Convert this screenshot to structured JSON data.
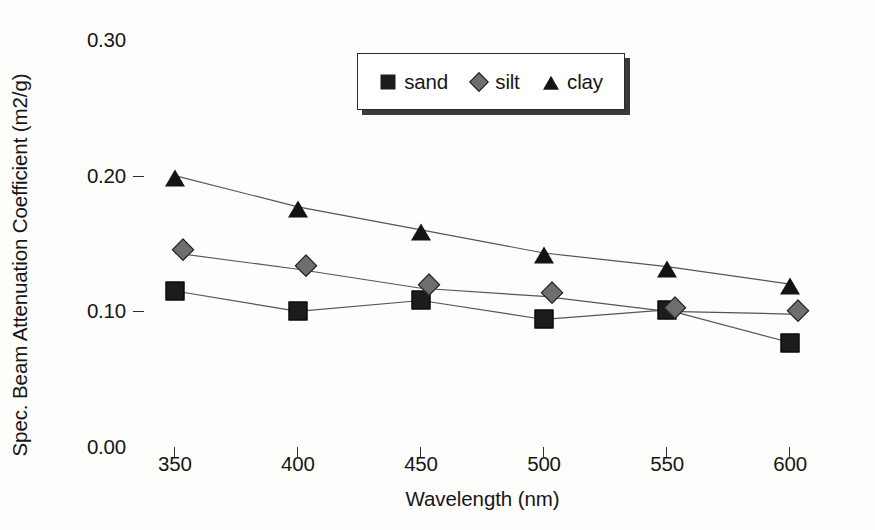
{
  "chart_data": {
    "type": "line",
    "title": "",
    "xlabel": "Wavelength (nm)",
    "ylabel": "Spec. Beam Attenuation Coefficient (m2/g)",
    "x": [
      350,
      400,
      450,
      500,
      550,
      600
    ],
    "xlim": [
      333,
      617
    ],
    "ylim": [
      0.0,
      0.3
    ],
    "xticks": [
      "350",
      "400",
      "450",
      "500",
      "550",
      "600"
    ],
    "yticks": [
      "0.00",
      "0.10",
      "0.20",
      "0.30"
    ],
    "ytick_values": [
      0.0,
      0.1,
      0.2,
      0.3
    ],
    "grid": false,
    "legend_position": "top-center",
    "series": [
      {
        "name": "sand",
        "marker": "square",
        "color": "#1c1c1c",
        "values": [
          0.115,
          0.1,
          0.108,
          0.094,
          0.101,
          0.077
        ]
      },
      {
        "name": "silt",
        "marker": "diamond",
        "color": "#6e6e6e",
        "values": [
          0.143,
          0.131,
          0.117,
          0.111,
          0.1,
          0.098
        ]
      },
      {
        "name": "clay",
        "marker": "triangle",
        "color": "#141414",
        "values": [
          0.2,
          0.177,
          0.16,
          0.143,
          0.133,
          0.12
        ]
      }
    ]
  },
  "legend": {
    "entries": [
      {
        "label": "sand",
        "marker": "square"
      },
      {
        "label": "silt",
        "marker": "diamond"
      },
      {
        "label": "clay",
        "marker": "triangle"
      }
    ]
  },
  "colors": {
    "axis": "#2b2b2b",
    "line": "#555555",
    "text": "#161616",
    "background": "#fdfdfc"
  }
}
